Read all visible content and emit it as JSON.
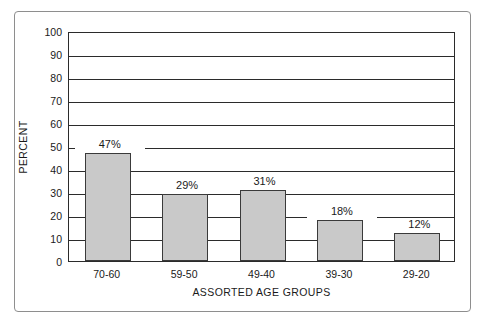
{
  "chart_data": {
    "type": "bar",
    "title": "",
    "subtitle": "",
    "xlabel": "ASSORTED AGE GROUPS",
    "ylabel": "PERCENT",
    "categories": [
      "70-60",
      "59-50",
      "49-40",
      "39-30",
      "29-20"
    ],
    "values": [
      47,
      29,
      31,
      18,
      12
    ],
    "value_labels": [
      "47%",
      "29%",
      "31%",
      "18%",
      "12%"
    ],
    "ylim": [
      0,
      100
    ],
    "yticks": [
      100,
      90,
      80,
      70,
      60,
      50,
      40,
      30,
      20,
      10,
      0
    ],
    "ytick_labels": [
      "100",
      "90",
      "80",
      "70",
      "60",
      "50",
      "40",
      "30",
      "20",
      "10",
      "0"
    ],
    "grid": "horizontal",
    "legend": "none",
    "bar_color": "#c9c9c9",
    "bar_border_color": "#3a3a3a",
    "axis_color": "#2b2b2b",
    "background": "#ffffff"
  },
  "figure": {
    "border_color": "#8e8e8e",
    "clipped_caption": ""
  }
}
